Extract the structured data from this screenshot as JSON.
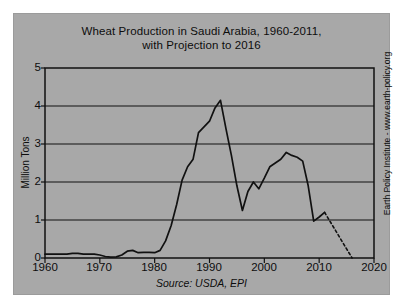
{
  "chart_data": {
    "type": "line",
    "title": "Wheat Production in Saudi Arabia, 1960-2011, with Projection to 2016",
    "title_lines": [
      "Wheat Production in Saudi Arabia, 1960-2011,",
      "with Projection to 2016"
    ],
    "xlabel": "",
    "ylabel": "Million Tons",
    "source": "Source: USDA, EPI",
    "credit": "Earth Policy Institute - www.earth-policy.org",
    "xlim": [
      1960,
      2020
    ],
    "ylim": [
      0,
      5
    ],
    "x_ticks": [
      1960,
      1970,
      1980,
      1990,
      2000,
      2010,
      2020
    ],
    "y_ticks": [
      0,
      1,
      2,
      3,
      4,
      5
    ],
    "grid": "horizontal",
    "legend": "none",
    "background_color": "#a8a8a8",
    "line_color": "#111111",
    "series": [
      {
        "name": "Wheat production (actual)",
        "style": "solid",
        "x": [
          1960,
          1961,
          1962,
          1963,
          1964,
          1965,
          1966,
          1967,
          1968,
          1969,
          1970,
          1971,
          1972,
          1973,
          1974,
          1975,
          1976,
          1977,
          1978,
          1979,
          1980,
          1981,
          1982,
          1983,
          1984,
          1985,
          1986,
          1987,
          1988,
          1989,
          1990,
          1991,
          1992,
          1993,
          1994,
          1995,
          1996,
          1997,
          1998,
          1999,
          2000,
          2001,
          2002,
          2003,
          2004,
          2005,
          2006,
          2007,
          2008,
          2009,
          2010,
          2011
        ],
        "values": [
          0.1,
          0.1,
          0.1,
          0.1,
          0.1,
          0.12,
          0.12,
          0.1,
          0.1,
          0.1,
          0.08,
          0.04,
          0.02,
          0.03,
          0.08,
          0.18,
          0.2,
          0.14,
          0.15,
          0.15,
          0.14,
          0.2,
          0.45,
          0.85,
          1.4,
          2.05,
          2.4,
          2.6,
          3.3,
          3.45,
          3.6,
          3.95,
          4.15,
          3.4,
          2.7,
          1.9,
          1.25,
          1.75,
          2.0,
          1.82,
          2.1,
          2.4,
          2.5,
          2.6,
          2.78,
          2.7,
          2.65,
          2.55,
          1.9,
          0.97,
          1.08,
          1.2
        ]
      },
      {
        "name": "Projection to 2016",
        "style": "dashed",
        "x": [
          2011,
          2012,
          2013,
          2014,
          2015,
          2016
        ],
        "values": [
          1.2,
          0.96,
          0.72,
          0.48,
          0.24,
          0.0
        ]
      }
    ]
  }
}
